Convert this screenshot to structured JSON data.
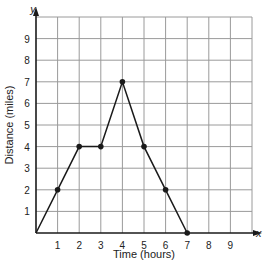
{
  "chart_data": {
    "type": "line",
    "title": "",
    "xlabel": "Time (hours)",
    "ylabel": "Distance (miles)",
    "x_axis_letter": "x",
    "y_axis_letter": "y",
    "x_ticks": [
      "1",
      "2",
      "3",
      "4",
      "5",
      "6",
      "7",
      "8",
      "9"
    ],
    "y_ticks": [
      "1",
      "2",
      "3",
      "4",
      "5",
      "6",
      "7",
      "8",
      "9"
    ],
    "xlim": [
      0,
      10
    ],
    "ylim": [
      0,
      10
    ],
    "grid": true,
    "series": [
      {
        "name": "distance",
        "x": [
          0,
          1,
          2,
          3,
          4,
          5,
          6,
          7
        ],
        "y": [
          0,
          2,
          4,
          4,
          7,
          4,
          2,
          0
        ],
        "markers_at": [
          [
            1,
            2
          ],
          [
            2,
            4
          ],
          [
            3,
            4
          ],
          [
            4,
            7
          ],
          [
            5,
            4
          ],
          [
            6,
            2
          ],
          [
            7,
            0
          ]
        ]
      }
    ],
    "colors": {
      "grid": "#9a9a9a",
      "line": "#1a1a1a",
      "axis": "#1a1a1a"
    }
  }
}
